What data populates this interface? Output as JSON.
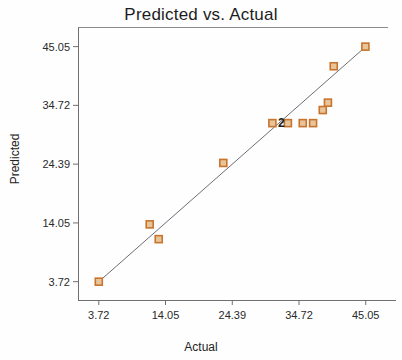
{
  "chart": {
    "title": "Predicted vs. Actual",
    "xlabel": "Actual",
    "ylabel": "Predicted"
  },
  "axes": {
    "x_ticks": [
      "3.72",
      "14.05",
      "24.39",
      "34.72",
      "45.05"
    ],
    "y_ticks": [
      "3.72",
      "14.05",
      "24.39",
      "34.72",
      "45.05"
    ]
  },
  "annotations": {
    "overlap_count": "2"
  },
  "style": {
    "marker_stroke": "#c8742d",
    "marker_fill": "#e8c49a",
    "reference_line": "#6d6d78",
    "axis": "#6f6f6f",
    "text": "#232323"
  },
  "chart_data": {
    "type": "scatter",
    "title": "Predicted vs. Actual",
    "xlabel": "Actual",
    "ylabel": "Predicted",
    "xlim": [
      0.5,
      48.5
    ],
    "ylim": [
      0.5,
      48.5
    ],
    "xticks": [
      3.72,
      14.05,
      24.39,
      34.72,
      45.05
    ],
    "yticks": [
      3.72,
      14.05,
      24.39,
      34.72,
      45.05
    ],
    "grid": false,
    "legend": null,
    "reference_line": {
      "type": "identity",
      "label": "y = x",
      "x": [
        3.72,
        45.05
      ],
      "y": [
        3.72,
        45.05
      ]
    },
    "series": [
      {
        "name": "Observations",
        "marker": "square",
        "points": [
          {
            "x": 3.72,
            "y": 3.72,
            "n": 1
          },
          {
            "x": 11.6,
            "y": 13.8,
            "n": 1
          },
          {
            "x": 13.0,
            "y": 11.2,
            "n": 1
          },
          {
            "x": 23.0,
            "y": 24.6,
            "n": 1
          },
          {
            "x": 30.6,
            "y": 31.6,
            "n": 1
          },
          {
            "x": 33.0,
            "y": 31.6,
            "n": 2
          },
          {
            "x": 35.3,
            "y": 31.6,
            "n": 1
          },
          {
            "x": 36.9,
            "y": 31.6,
            "n": 1
          },
          {
            "x": 38.4,
            "y": 33.9,
            "n": 1
          },
          {
            "x": 39.2,
            "y": 35.2,
            "n": 1
          },
          {
            "x": 40.1,
            "y": 41.6,
            "n": 1
          },
          {
            "x": 45.0,
            "y": 45.05,
            "n": 1
          }
        ]
      }
    ],
    "annotations": [
      {
        "text": "2",
        "x": 32.0,
        "y": 31.6,
        "note": "overlapping point count"
      }
    ]
  }
}
